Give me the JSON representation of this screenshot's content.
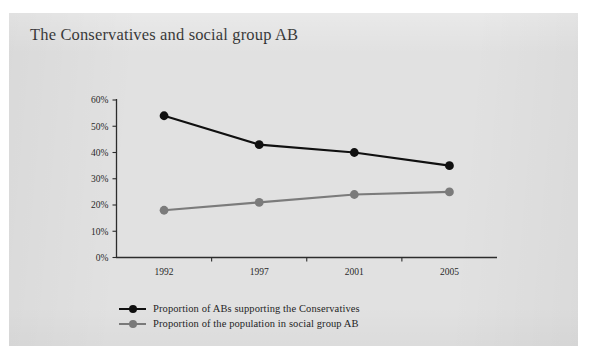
{
  "slide": {
    "title": "The Conservatives and social group AB",
    "background_color": "#e1e1e1",
    "page_background_color": "#ffffff"
  },
  "chart_data": {
    "type": "line",
    "title": "The Conservatives and social group AB",
    "xlabel": "",
    "ylabel": "",
    "categories": [
      "1992",
      "1997",
      "2001",
      "2005"
    ],
    "x_tick_labels": [
      "1992",
      "1997",
      "2001",
      "2005"
    ],
    "y_tick_labels": [
      "0%",
      "10%",
      "20%",
      "30%",
      "40%",
      "50%",
      "60%"
    ],
    "y_tick_values": [
      0,
      10,
      20,
      30,
      40,
      50,
      60
    ],
    "ylim": [
      0,
      60
    ],
    "y_unit": "%",
    "grid": false,
    "legend_position": "bottom-left",
    "series": [
      {
        "name": "Proportion of ABs supporting the Conservatives",
        "color": "#101010",
        "marker": "circle",
        "values": [
          54,
          43,
          40,
          35
        ]
      },
      {
        "name": "Proportion of the population in social group AB",
        "color": "#7b7b7b",
        "marker": "circle",
        "values": [
          18,
          21,
          24,
          25
        ]
      }
    ]
  },
  "legend": {
    "items": [
      {
        "label": "Proportion of ABs supporting the Conservatives",
        "color": "#101010"
      },
      {
        "label": "Proportion of the population in social group AB",
        "color": "#7b7b7b"
      }
    ]
  }
}
